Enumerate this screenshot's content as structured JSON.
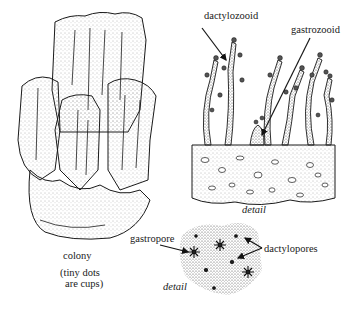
{
  "figure": {
    "panels": [
      {
        "id": "colony",
        "caption": "colony",
        "note_line1": "(tiny dots",
        "note_line2": "are cups)"
      },
      {
        "id": "zooid-detail",
        "caption": "detail",
        "labels": {
          "dactylozooid": "dactylozooid",
          "gastrozooid": "gastrozooid"
        }
      },
      {
        "id": "pore-detail",
        "caption": "detail",
        "labels": {
          "gastropore": "gastropore",
          "dactylopores": "dactylopores"
        }
      }
    ],
    "colors": {
      "ink": "#1a1a1a",
      "stipple": "#555555",
      "background": "#ffffff"
    }
  }
}
